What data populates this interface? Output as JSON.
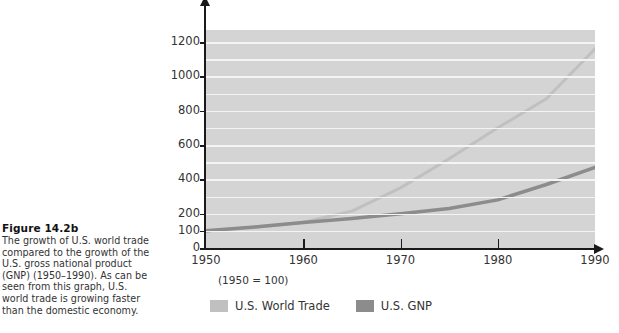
{
  "caption": {
    "title": "Figure 14.2b",
    "body": "The growth of U.S. world trade compared to the growth of the U.S. gross national product (GNP) (1950–1990). As can be seen from this graph, U.S. world trade is growing faster than the domestic economy."
  },
  "figure": {
    "base_note": "(1950 = 100)"
  },
  "colors": {
    "plot_background": "#d4d4d4",
    "gridline": "#f4f4f4",
    "axis": "#1a1a1a",
    "world_trade": "#c0c0c0",
    "gnp": "#8c8c8c",
    "text": "#333333"
  },
  "chart_data": {
    "type": "line",
    "title": "",
    "subtitle": "",
    "xlabel": "",
    "ylabel": "",
    "note": "(1950 = 100)",
    "x": [
      1950,
      1955,
      1960,
      1965,
      1970,
      1975,
      1980,
      1985,
      1990
    ],
    "xticks": [
      1950,
      1960,
      1970,
      1980,
      1990
    ],
    "xlim": [
      1950,
      1990
    ],
    "yticks": [
      0,
      100,
      200,
      400,
      600,
      800,
      1000,
      1200
    ],
    "gridlines": [
      100,
      200,
      300,
      400,
      500,
      600,
      700,
      800,
      900,
      1000,
      1100,
      1200
    ],
    "ylim": [
      0,
      1270
    ],
    "grid": true,
    "legend_position": "below",
    "series": [
      {
        "name": "U.S. World Trade",
        "color": "#c0c0c0",
        "values": [
          100,
          120,
          150,
          215,
          350,
          520,
          700,
          870,
          1160
        ]
      },
      {
        "name": "U.S. GNP",
        "color": "#8c8c8c",
        "values": [
          100,
          122,
          148,
          172,
          200,
          230,
          280,
          370,
          470
        ]
      }
    ]
  },
  "legend": {
    "items": [
      {
        "label": "U.S. World Trade",
        "color": "#c0c0c0"
      },
      {
        "label": "U.S. GNP",
        "color": "#8c8c8c"
      }
    ]
  }
}
